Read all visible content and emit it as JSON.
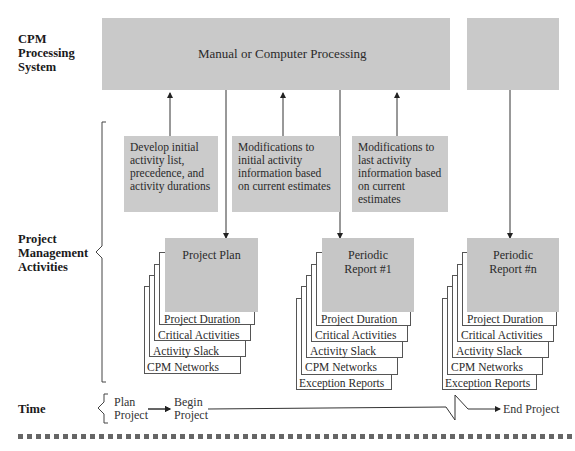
{
  "rows": {
    "processing": "CPM\nProcessing\nSystem",
    "activities": "Project\nManagement\nActivities",
    "time": "Time"
  },
  "processing_bar": {
    "label": "Manual or Computer Processing",
    "color": "#c9c9c9"
  },
  "notes": [
    {
      "text": "Develop initial activity list, precedence, and activity durations"
    },
    {
      "text": "Modifications to initial activity information based on current estimates"
    },
    {
      "text": "Modifications to last activity information based on current estimates"
    }
  ],
  "stacks": [
    {
      "title": "Project Plan",
      "layers": [
        "Project Duration",
        "Critical Activities",
        "Activity Slack",
        "CPM Networks"
      ]
    },
    {
      "title": "Periodic Report #1",
      "layers": [
        "Project Duration",
        "Critical Activities",
        "Activity Slack",
        "CPM Networks",
        "Exception Reports"
      ]
    },
    {
      "title": "Periodic Report #n",
      "layers": [
        "Project Duration",
        "Critical Activities",
        "Activity Slack",
        "CPM Networks",
        "Exception Reports"
      ]
    }
  ],
  "timeline": {
    "plan": "Plan\nProject",
    "begin": "Begin\nProject",
    "end": "End Project"
  }
}
